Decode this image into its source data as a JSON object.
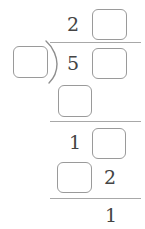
{
  "figure": {
    "type": "long-division-worksheet",
    "colors": {
      "text": "#444444",
      "box_border": "#9a9a9a",
      "rule": "#a8a8a8",
      "background": "#ffffff"
    },
    "rows": [
      {
        "name": "quotient",
        "cells": [
          {
            "kind": "digit",
            "value": "2"
          },
          {
            "kind": "blank",
            "value": ""
          }
        ]
      },
      {
        "name": "divisor-dividend",
        "cells": [
          {
            "kind": "blank",
            "value": ""
          },
          {
            "kind": "bracket",
            "value": ")"
          },
          {
            "kind": "digit",
            "value": "5"
          },
          {
            "kind": "blank",
            "value": ""
          }
        ]
      },
      {
        "name": "first-subtraction",
        "cells": [
          {
            "kind": "blank",
            "value": ""
          }
        ]
      },
      {
        "name": "bring-down",
        "cells": [
          {
            "kind": "digit",
            "value": "1"
          },
          {
            "kind": "blank",
            "value": ""
          }
        ]
      },
      {
        "name": "second-subtraction",
        "cells": [
          {
            "kind": "blank",
            "value": ""
          },
          {
            "kind": "digit",
            "value": "2"
          }
        ]
      },
      {
        "name": "remainder",
        "cells": [
          {
            "kind": "digit",
            "value": "1"
          }
        ]
      }
    ],
    "digits": {
      "quotient_tens": "2",
      "dividend_hundreds": "5",
      "bring_down_tens": "1",
      "second_sub_ones": "2",
      "remainder": "1"
    },
    "rules": [
      {
        "name": "vinculum"
      },
      {
        "name": "first-subtraction-rule"
      },
      {
        "name": "second-subtraction-rule"
      }
    ],
    "blank_count": 6
  }
}
